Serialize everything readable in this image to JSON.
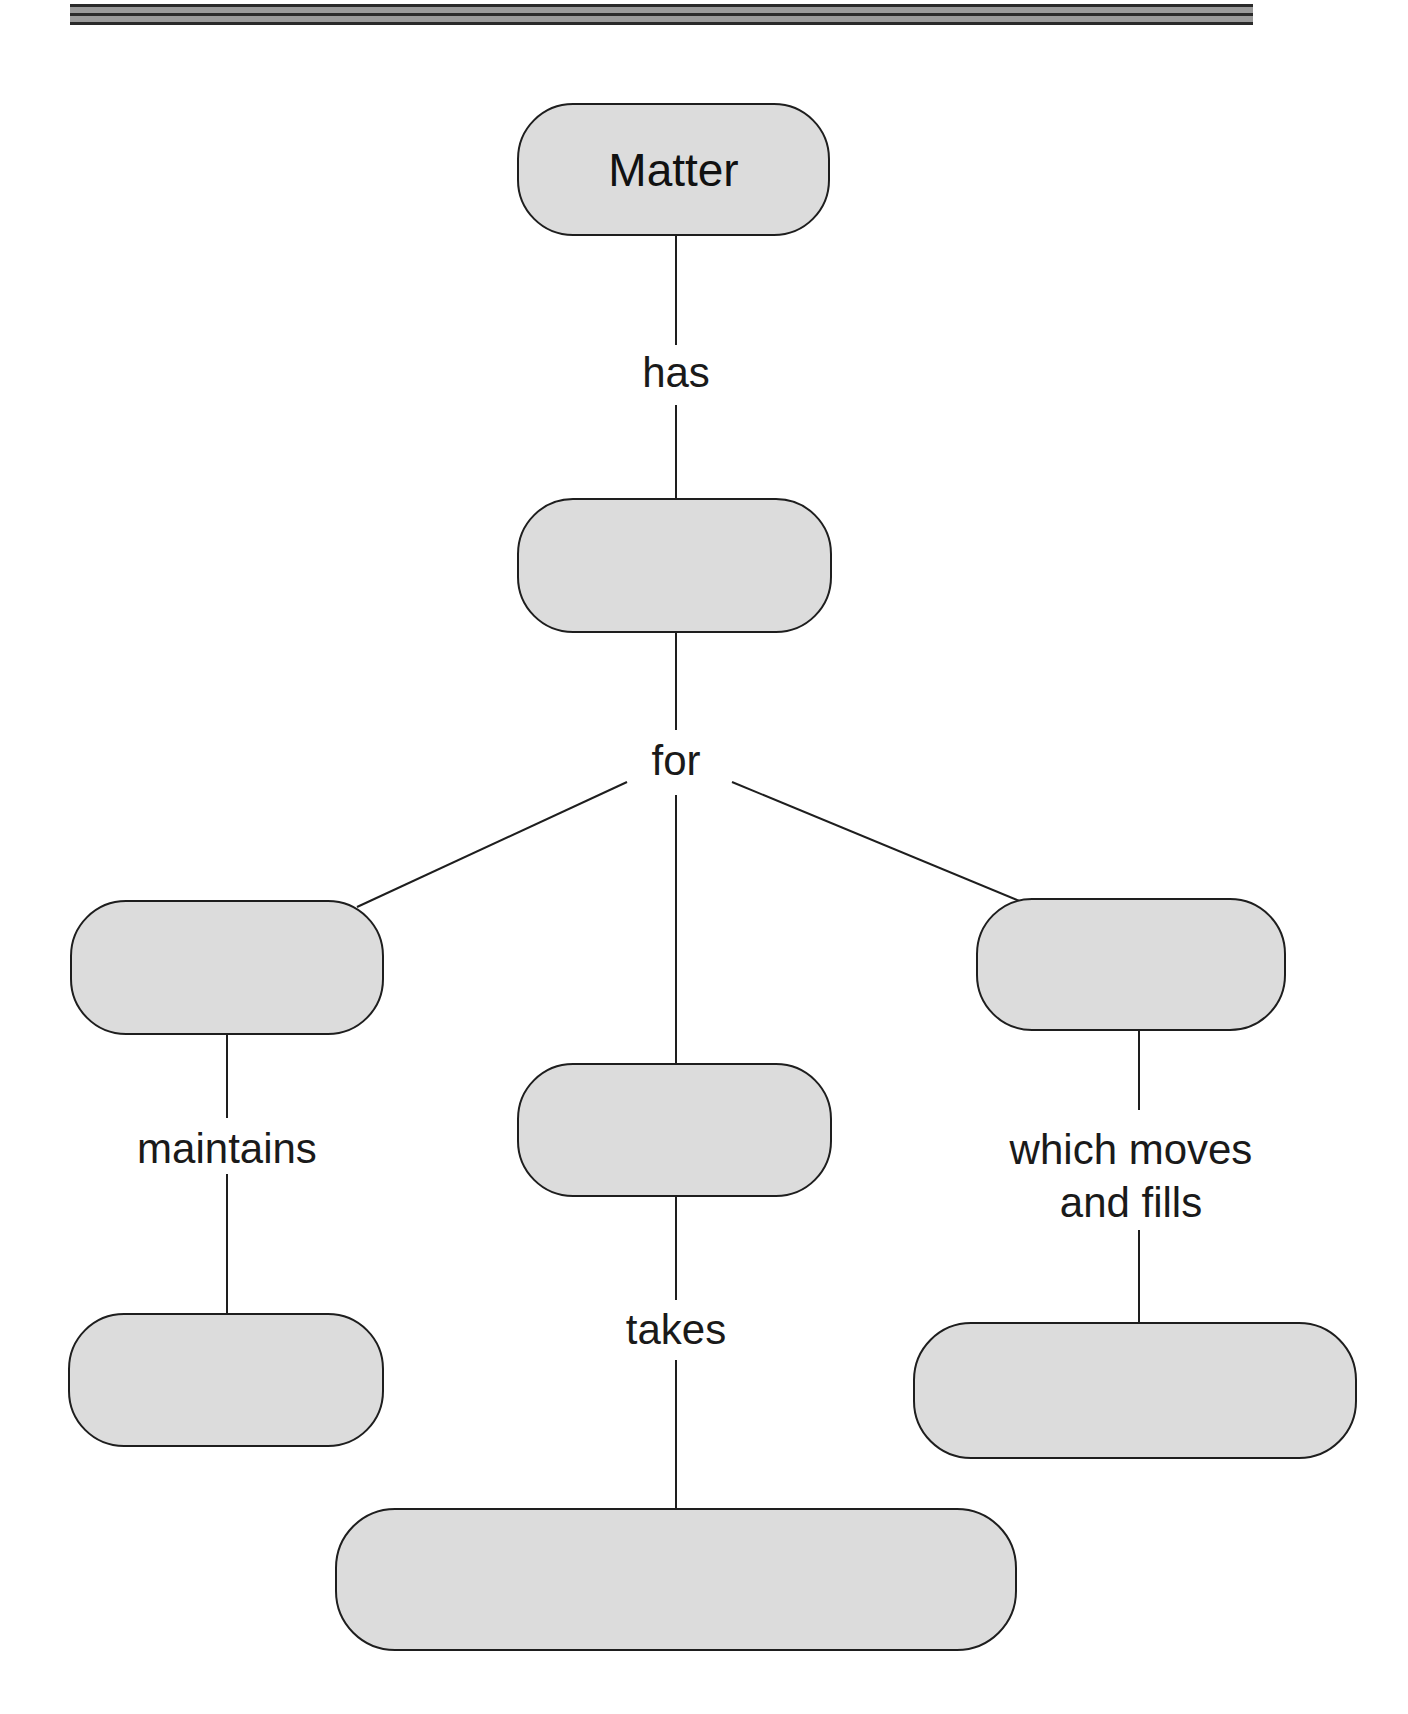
{
  "diagram": {
    "type": "concept-map",
    "header_rule": {
      "dark": "#2a2a2a",
      "grey": "#9a9a9a"
    },
    "colors": {
      "node_fill": "#dcdcdc",
      "node_border": "#1e1e1e",
      "line": "#1e1e1e",
      "text": "#111111"
    },
    "nodes": {
      "root": {
        "label": "Matter"
      },
      "level2": {
        "label": ""
      },
      "left": {
        "label": ""
      },
      "center": {
        "label": ""
      },
      "right": {
        "label": ""
      },
      "left_bottom": {
        "label": ""
      },
      "right_bottom": {
        "label": ""
      },
      "center_bottom": {
        "label": ""
      }
    },
    "links": {
      "has": "has",
      "for": "for",
      "maintains": "maintains",
      "takes": "takes",
      "which_moves_line1": "which moves",
      "which_moves_line2": "and fills"
    }
  }
}
